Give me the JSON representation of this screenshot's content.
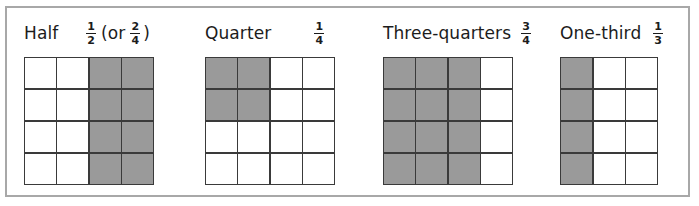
{
  "figure": {
    "frame_color": "#a8a8a8",
    "shade_color": "#9a9a9a",
    "line_color": "#3a3a3a",
    "cell_blank_color": "#ffffff"
  },
  "panels": [
    {
      "id": "half",
      "label": "Half",
      "fraction_text": "1/2 (or 2/4)",
      "fractions": [
        {
          "numerator": "1",
          "denominator": "2"
        },
        {
          "numerator": "2",
          "denominator": "4"
        }
      ],
      "connector_open": "(or",
      "connector_close": ")",
      "grid": {
        "columns": 4,
        "rows": 4,
        "shaded_cells": 8,
        "total_cells": 16,
        "shaded_columns": [
          3,
          4
        ],
        "cells": [
          [
            0,
            0,
            1,
            1
          ],
          [
            0,
            0,
            1,
            1
          ],
          [
            0,
            0,
            1,
            1
          ],
          [
            0,
            0,
            1,
            1
          ]
        ]
      }
    },
    {
      "id": "quarter",
      "label": "Quarter",
      "fraction_text": "1/4",
      "fractions": [
        {
          "numerator": "1",
          "denominator": "4"
        }
      ],
      "grid": {
        "columns": 4,
        "rows": 4,
        "shaded_cells": 4,
        "total_cells": 16,
        "shaded_columns": [
          1,
          2
        ],
        "cells": [
          [
            1,
            1,
            0,
            0
          ],
          [
            1,
            1,
            0,
            0
          ],
          [
            0,
            0,
            0,
            0
          ],
          [
            0,
            0,
            0,
            0
          ]
        ]
      }
    },
    {
      "id": "three-quarters",
      "label": "Three-quarters",
      "fraction_text": "3/4",
      "fractions": [
        {
          "numerator": "3",
          "denominator": "4"
        }
      ],
      "grid": {
        "columns": 4,
        "rows": 4,
        "shaded_cells": 12,
        "total_cells": 16,
        "shaded_columns": [
          1,
          2,
          3
        ],
        "cells": [
          [
            1,
            1,
            1,
            0
          ],
          [
            1,
            1,
            1,
            0
          ],
          [
            1,
            1,
            1,
            0
          ],
          [
            1,
            1,
            1,
            0
          ]
        ]
      }
    },
    {
      "id": "one-third",
      "label": "One-third",
      "fraction_text": "1/3",
      "fractions": [
        {
          "numerator": "1",
          "denominator": "3"
        }
      ],
      "grid": {
        "columns": 3,
        "rows": 4,
        "shaded_cells": 4,
        "total_cells": 12,
        "shaded_columns": [
          1
        ],
        "cells": [
          [
            1,
            0,
            0
          ],
          [
            1,
            0,
            0
          ],
          [
            1,
            0,
            0
          ],
          [
            1,
            0,
            0
          ]
        ]
      }
    }
  ]
}
